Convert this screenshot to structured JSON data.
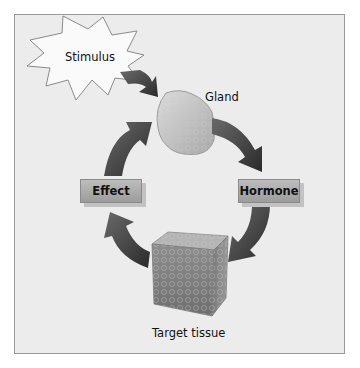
{
  "diagram": {
    "title": "",
    "nodes": {
      "stimulus": "Stimulus",
      "gland": "Gland",
      "hormone": "Hormone",
      "target_tissue": "Target tissue",
      "effect": "Effect"
    },
    "edges": [
      {
        "from": "Stimulus",
        "to": "Gland"
      },
      {
        "from": "Gland",
        "to": "Hormone"
      },
      {
        "from": "Hormone",
        "to": "Target tissue"
      },
      {
        "from": "Target tissue",
        "to": "Effect"
      },
      {
        "from": "Effect",
        "to": "Gland"
      }
    ],
    "colors": {
      "background": "#ececec",
      "border": "#9a9a9a",
      "arrow": "#3a3a3a",
      "label_box": "#aaaaaa"
    }
  }
}
